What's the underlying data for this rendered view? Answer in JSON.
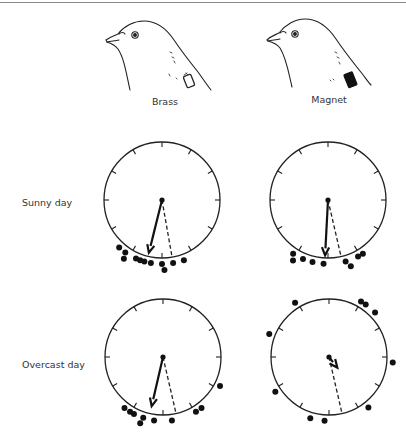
{
  "columns": [
    {
      "id": "brass",
      "label": "Brass",
      "tag_color": "#ffffff"
    },
    {
      "id": "magnet",
      "label": "Magnet",
      "tag_color": "#111111"
    }
  ],
  "rows": [
    {
      "id": "sunny",
      "label": "Sunny day"
    },
    {
      "id": "overcast",
      "label": "Overcast day"
    }
  ],
  "chart_data": {
    "type": "circular-scatter",
    "title": "",
    "panels": [
      {
        "column": "Brass",
        "row": "Sunny day",
        "mean_vector_angle_deg": 194,
        "mean_vector_length": 0.97,
        "home_angle_deg": 170,
        "bearings_deg": [
          222,
          215,
          204,
          213,
          200,
          196,
          190,
          180,
          178,
          170,
          160
        ]
      },
      {
        "column": "Magnet",
        "row": "Sunny day",
        "mean_vector_angle_deg": 183,
        "mean_vector_length": 0.99,
        "home_angle_deg": 167,
        "bearings_deg": [
          213,
          210,
          203,
          194,
          184,
          164,
          161,
          152,
          147
        ]
      },
      {
        "column": "Brass",
        "row": "Overcast day",
        "mean_vector_angle_deg": 193,
        "mean_vector_length": 0.9,
        "home_angle_deg": 167,
        "bearings_deg": [
          217,
          211,
          207,
          198,
          199,
          188,
          172,
          149,
          143,
          117
        ]
      },
      {
        "column": "Magnet",
        "row": "Overcast day",
        "mean_vector_angle_deg": 142,
        "mean_vector_length": 0.24,
        "home_angle_deg": 167,
        "bearings_deg": [
          328,
          30,
          35,
          46,
          291,
          237,
          197,
          184,
          142,
          95
        ]
      }
    ],
    "tick_count": 12,
    "xlabel": "",
    "ylabel": ""
  }
}
